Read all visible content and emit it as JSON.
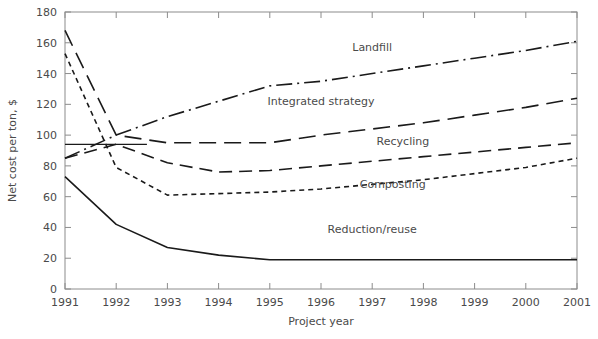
{
  "chart_data": {
    "type": "line",
    "title": "",
    "xlabel": "Project year",
    "ylabel": "Net cost per ton, $",
    "x": [
      1991,
      1992,
      1993,
      1994,
      1995,
      1996,
      1997,
      1998,
      1999,
      2000,
      2001
    ],
    "xtick_labels": [
      "1991",
      "1992",
      "1993",
      "1994",
      "1995",
      "1996",
      "1997",
      "1998",
      "1999",
      "2000",
      "2001"
    ],
    "ytick_labels": [
      "0",
      "20",
      "40",
      "60",
      "80",
      "100",
      "120",
      "140",
      "160",
      "180"
    ],
    "ytick_values": [
      0,
      20,
      40,
      60,
      80,
      100,
      120,
      140,
      160,
      180
    ],
    "xlim": [
      1991,
      2001
    ],
    "ylim": [
      0,
      180
    ],
    "grid": false,
    "legend": "inline-annotations",
    "series": [
      {
        "name": "Landfill",
        "style": "dash-dot",
        "color": "#1a1a1a",
        "values": [
          85,
          100,
          112,
          122,
          132,
          135,
          140,
          145,
          150,
          155,
          161
        ],
        "label_x": 1997.0,
        "label_y": 157
      },
      {
        "name": "Integrated strategy",
        "style": "long-dash",
        "color": "#1a1a1a",
        "values": [
          168,
          100,
          95,
          95,
          95,
          100,
          104,
          108,
          113,
          118,
          124
        ],
        "label_x": 1996.0,
        "label_y": 122
      },
      {
        "name": "Recycling",
        "style": "dash",
        "color": "#1a1a1a",
        "values": [
          85,
          94,
          82,
          76,
          77,
          80,
          83,
          86,
          89,
          92,
          95
        ],
        "label_x": 1997.6,
        "label_y": 96
      },
      {
        "name": "Composting",
        "style": "dotted-dash",
        "color": "#1a1a1a",
        "values": [
          153,
          79,
          61,
          62,
          63,
          65,
          68,
          71,
          75,
          79,
          85
        ],
        "label_x": 1997.4,
        "label_y": 68
      },
      {
        "name": "Reduction/reuse",
        "style": "solid",
        "color": "#1a1a1a",
        "values": [
          73,
          42,
          27,
          22,
          19,
          19,
          19,
          19,
          19,
          19,
          19
        ],
        "label_x": 1997.0,
        "label_y": 39
      },
      {
        "name": "baseline-flat",
        "style": "solid-thin",
        "color": "#1a1a1a",
        "values": [
          94,
          94,
          94,
          94,
          94,
          94,
          94,
          94,
          94,
          94,
          94
        ],
        "hidden_label": true,
        "partial_to": 1992.6
      }
    ]
  },
  "axis": {
    "y_title": "Net cost per ton, $",
    "x_title": "Project year"
  }
}
